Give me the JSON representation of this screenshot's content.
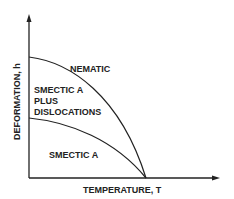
{
  "diagram": {
    "type": "phase-diagram",
    "x_axis_label": "TEMPERATURE, T",
    "y_axis_label": "DEFORMATION, h",
    "regions": {
      "top": "NEMATIC",
      "middle": [
        "SMECTIC A",
        "PLUS",
        "DISLOCATIONS"
      ],
      "bottom": "SMECTIC A"
    },
    "curves": [
      {
        "name": "upper-phase-boundary",
        "from": "y-axis high",
        "to": "critical temperature on x-axis",
        "shape": "concave-down"
      },
      {
        "name": "lower-phase-boundary",
        "from": "y-axis mid",
        "to": "critical temperature on x-axis",
        "shape": "concave-down, shallower"
      }
    ],
    "colors": {
      "line": "#222222",
      "background": "#ffffff"
    }
  }
}
